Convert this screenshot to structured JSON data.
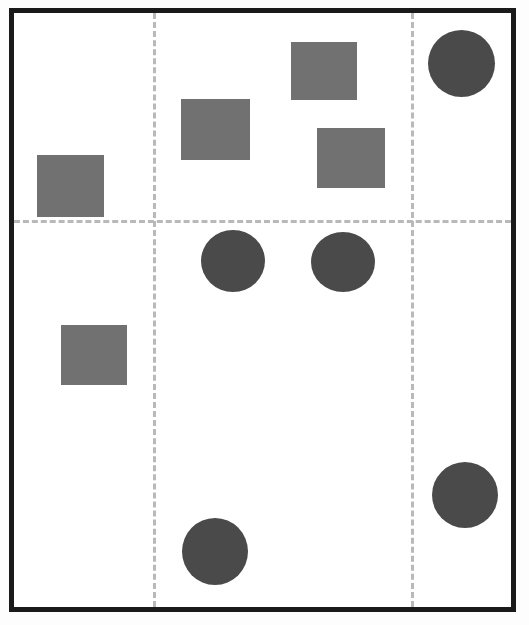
{
  "figure": {
    "title": "",
    "background_color": "#ffffff",
    "frame_color": "#1a1a1a",
    "frame_width_px": 5,
    "width_px": 529,
    "height_px": 625
  },
  "gridlines": {
    "style": "dashed",
    "color": "#b9b9b9",
    "vertical": [
      {
        "name": "gridline-vertical-1",
        "x": 139
      },
      {
        "name": "gridline-vertical-2",
        "x": 397
      }
    ],
    "horizontal": [
      {
        "name": "gridline-horizontal-1",
        "y": 207
      }
    ]
  },
  "chart_data": {
    "type": "scatter",
    "title": "",
    "xlabel": "",
    "ylabel": "",
    "xlim": [
      0,
      497
    ],
    "ylim": [
      0,
      594
    ],
    "grid": true,
    "legend": "none",
    "series": [
      {
        "name": "squares",
        "marker": "square",
        "color": "#717171",
        "points": [
          {
            "label": "square-1",
            "x": 23,
            "y": 142,
            "width": 67,
            "height": 62
          },
          {
            "label": "square-2",
            "x": 167,
            "y": 86,
            "width": 69,
            "height": 61
          },
          {
            "label": "square-3",
            "x": 277,
            "y": 29,
            "width": 66,
            "height": 58
          },
          {
            "label": "square-4",
            "x": 303,
            "y": 115,
            "width": 68,
            "height": 60
          },
          {
            "label": "square-5",
            "x": 47,
            "y": 312,
            "width": 66,
            "height": 60
          }
        ]
      },
      {
        "name": "circles",
        "marker": "circle",
        "color": "#4a4a4a",
        "points": [
          {
            "label": "circle-1",
            "x": 414,
            "y": 17,
            "width": 67,
            "height": 67
          },
          {
            "label": "circle-2",
            "x": 187,
            "y": 217,
            "width": 64,
            "height": 62
          },
          {
            "label": "circle-3",
            "x": 297,
            "y": 219,
            "width": 64,
            "height": 60
          },
          {
            "label": "circle-4",
            "x": 168,
            "y": 505,
            "width": 66,
            "height": 67
          },
          {
            "label": "circle-5",
            "x": 418,
            "y": 449,
            "width": 66,
            "height": 66
          }
        ]
      }
    ]
  }
}
